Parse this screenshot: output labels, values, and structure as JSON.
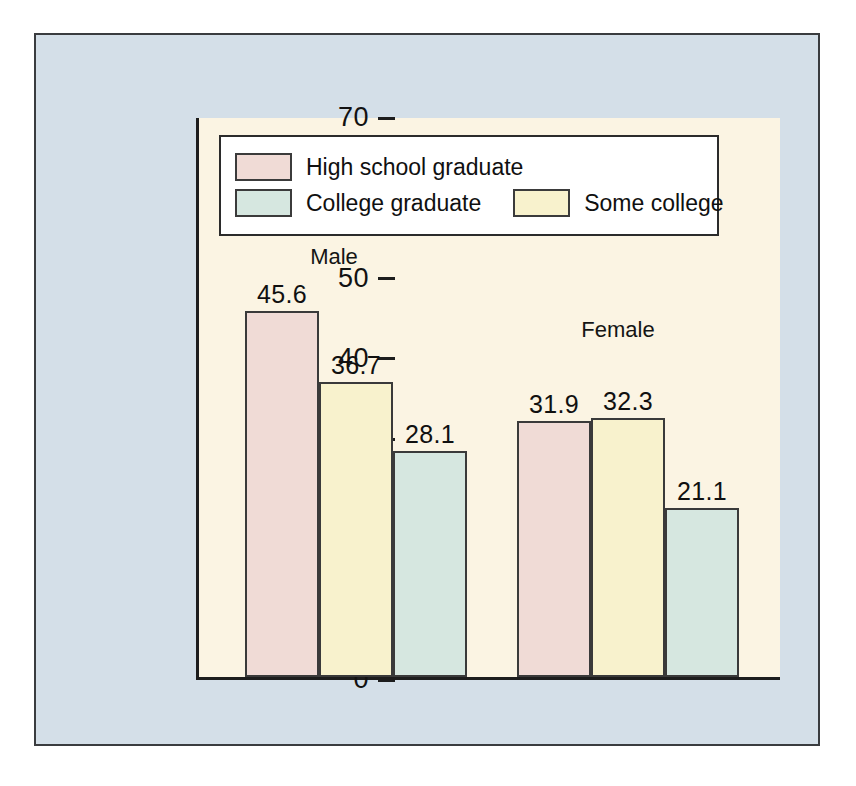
{
  "figure": {
    "panel_bg": "#d4dfe8",
    "plot_bg": "#fbf4e3",
    "axis_color": "#1d1d1d"
  },
  "legend": {
    "items": [
      {
        "label": "High school graduate",
        "color": "#f0dbd6",
        "key": "high_school"
      },
      {
        "label": "College graduate",
        "color": "#d6e7e0",
        "key": "college_grad"
      },
      {
        "label": "Some college",
        "color": "#f8f2cd",
        "key": "some_college"
      }
    ]
  },
  "chart_data": {
    "type": "bar",
    "title": "",
    "xlabel": "",
    "ylabel": "Smokers (%)",
    "ylim": [
      0,
      70
    ],
    "yticks": [
      0,
      10,
      20,
      30,
      40,
      50,
      60,
      70
    ],
    "ytick_labels": [
      "0",
      "10",
      "20",
      "30",
      "40",
      "50",
      "60",
      "70"
    ],
    "grid": false,
    "legend_position": "top-left-inside",
    "categories": [
      "Male",
      "Female"
    ],
    "series": [
      {
        "name": "High school graduate",
        "color": "#f0dbd6",
        "values": [
          45.6,
          31.9
        ]
      },
      {
        "name": "Some college",
        "color": "#f8f2cd",
        "values": [
          36.7,
          32.3
        ]
      },
      {
        "name": "College graduate",
        "color": "#d6e7e0",
        "values": [
          28.1,
          21.1
        ]
      }
    ],
    "bar_order_in_group": [
      "High school graduate",
      "Some college",
      "College graduate"
    ],
    "data_labels": [
      {
        "group": "Male",
        "series": "High school graduate",
        "value": "45.6"
      },
      {
        "group": "Male",
        "series": "Some college",
        "value": "36.7"
      },
      {
        "group": "Male",
        "series": "College graduate",
        "value": "28.1"
      },
      {
        "group": "Female",
        "series": "High school graduate",
        "value": "31.9"
      },
      {
        "group": "Female",
        "series": "Some college",
        "value": "32.3"
      },
      {
        "group": "Female",
        "series": "College graduate",
        "value": "21.1"
      }
    ]
  }
}
